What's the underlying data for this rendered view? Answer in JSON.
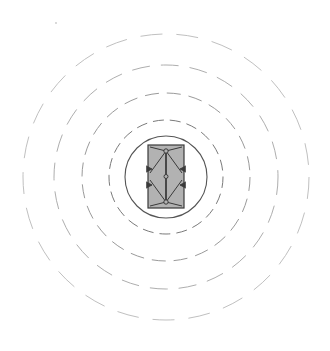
{
  "figure": {
    "title": "Concentric Zone Diagram",
    "background_color": "#ffffff",
    "width": 330,
    "height": 351,
    "center_x": 166,
    "center_y": 177
  },
  "chart_data": {
    "type": "diagram",
    "title": "Concentric Zone Diagram",
    "subtitle": "",
    "xlabel": "",
    "ylabel": "",
    "grid": false,
    "legend_position": "none",
    "annotations": [],
    "center": {
      "x": 166,
      "y": 177
    },
    "rings": [
      {
        "name": "inner-solid-circle",
        "radius": 41,
        "stroke": "#555555",
        "stroke_width": 1.1,
        "dash": "none",
        "fill": "none",
        "label": ""
      },
      {
        "name": "dashed-ring-1",
        "radius": 57,
        "stroke": "#7a7a7a",
        "stroke_width": 1.0,
        "dash": "11 6",
        "fill": "none",
        "label": ""
      },
      {
        "name": "dashed-ring-2",
        "radius": 84,
        "stroke": "#9a9a9a",
        "stroke_width": 1.0,
        "dash": "14 8",
        "fill": "none",
        "label": ""
      },
      {
        "name": "dashed-ring-3",
        "radius": 112,
        "stroke": "#aeaeae",
        "stroke_width": 1.0,
        "dash": "18 11",
        "fill": "none",
        "label": ""
      },
      {
        "name": "dashed-ring-4",
        "radius": 143,
        "stroke": "#c0c0c0",
        "stroke_width": 1.0,
        "dash": "22 14",
        "fill": "none",
        "label": ""
      }
    ],
    "core": {
      "name": "core-rectangle",
      "x": 148,
      "y": 145,
      "width": 36,
      "height": 63,
      "fill": "#b2b2b2",
      "stroke": "#3a3a3a",
      "stroke_width": 1.2,
      "label": ""
    },
    "core_members": {
      "vertical_spine": {
        "x": 166,
        "y_top": 151,
        "y_bottom": 202,
        "stroke": "#2e2e2e",
        "stroke_width": 1.6
      },
      "nodes": [
        {
          "x": 166,
          "y": 151,
          "r": 2.2
        },
        {
          "x": 166,
          "y": 176.5,
          "r": 2.0
        },
        {
          "x": 166,
          "y": 202,
          "r": 2.2
        }
      ],
      "diagonals": [
        {
          "x1": 150,
          "y1": 147,
          "x2": 166,
          "y2": 151
        },
        {
          "x1": 182,
          "y1": 147,
          "x2": 166,
          "y2": 151
        },
        {
          "x1": 150,
          "y1": 173,
          "x2": 166,
          "y2": 151
        },
        {
          "x1": 182,
          "y1": 173,
          "x2": 166,
          "y2": 151
        },
        {
          "x1": 150,
          "y1": 180,
          "x2": 166,
          "y2": 202
        },
        {
          "x1": 182,
          "y1": 180,
          "x2": 166,
          "y2": 202
        },
        {
          "x1": 150,
          "y1": 206,
          "x2": 166,
          "y2": 202
        },
        {
          "x1": 182,
          "y1": 206,
          "x2": 166,
          "y2": 202
        }
      ],
      "arrows": [
        {
          "name": "arrow-upper-left",
          "x": 152,
          "y": 169,
          "direction": "right"
        },
        {
          "name": "arrow-upper-right",
          "x": 180,
          "y": 169,
          "direction": "left"
        },
        {
          "name": "arrow-lower-left",
          "x": 152,
          "y": 185,
          "direction": "right"
        },
        {
          "name": "arrow-lower-right",
          "x": 180,
          "y": 185,
          "direction": "left"
        }
      ],
      "stroke": "#3a3a3a",
      "stroke_width": 1.0
    },
    "speck": {
      "x": 56,
      "y": 23,
      "r": 0.9,
      "fill": "#c8c8c8"
    }
  },
  "colors": {
    "background": "#ffffff",
    "core_fill": "#b2b2b2",
    "core_stroke": "#3a3a3a",
    "ring_solid": "#555555",
    "ring_dash_inner": "#7a7a7a",
    "ring_dash_outer": "#c0c0c0"
  }
}
